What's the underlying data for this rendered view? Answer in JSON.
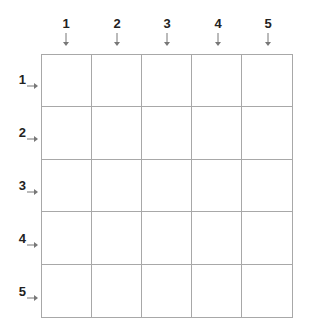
{
  "columns": [
    {
      "label": "1",
      "x": 66
    },
    {
      "label": "2",
      "x": 117
    },
    {
      "label": "3",
      "x": 167
    },
    {
      "label": "4",
      "x": 218
    },
    {
      "label": "5",
      "x": 268
    }
  ],
  "rows": [
    {
      "label": "1",
      "y": 80
    },
    {
      "label": "2",
      "y": 133
    },
    {
      "label": "3",
      "y": 186
    },
    {
      "label": "4",
      "y": 239
    },
    {
      "label": "5",
      "y": 292
    }
  ],
  "grid": {
    "rows": 5,
    "cols": 5,
    "line_color": "#a8a8a8",
    "arrow_color": "#777777"
  }
}
